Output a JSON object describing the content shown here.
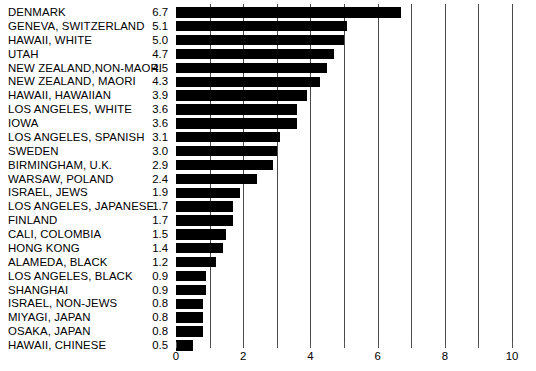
{
  "chart_data": {
    "type": "bar",
    "orientation": "horizontal",
    "title": "",
    "subtitle": "",
    "xlabel": "",
    "ylabel": "",
    "xlim": [
      0,
      10.6
    ],
    "xticks": [
      0,
      1,
      2,
      3,
      4,
      5,
      6,
      7,
      8,
      9,
      10
    ],
    "xtick_labels": [
      "0",
      "",
      "2",
      "",
      "4",
      "",
      "6",
      "",
      "8",
      "",
      "10"
    ],
    "grid": "vertical",
    "legend": "none",
    "bar_color": "#000000",
    "gridline_color": "#4a4a4a",
    "background_color": "#ffffff",
    "categories": [
      "DENMARK",
      "GENEVA, SWITZERLAND",
      "HAWAII, WHITE",
      "UTAH",
      "NEW ZEALAND,NON-MAORI",
      "NEW ZEALAND, MAORI",
      "HAWAII, HAWAIIAN",
      "LOS ANGELES, WHITE",
      "IOWA",
      "LOS ANGELES, SPANISH",
      "SWEDEN",
      "BIRMINGHAM, U.K.",
      "WARSAW, POLAND",
      "ISRAEL, JEWS",
      "LOS ANGELES, JAPANESE",
      "FINLAND",
      "CALI, COLOMBIA",
      "HONG KONG",
      "ALAMEDA, BLACK",
      "LOS ANGELES, BLACK",
      "SHANGHAI",
      "ISRAEL, NON-JEWS",
      "MIYAGI, JAPAN",
      "OSAKA, JAPAN",
      "HAWAII, CHINESE"
    ],
    "values": [
      6.7,
      5.1,
      5.0,
      4.7,
      4.5,
      4.3,
      3.9,
      3.6,
      3.6,
      3.1,
      3.0,
      2.9,
      2.4,
      1.9,
      1.7,
      1.7,
      1.5,
      1.4,
      1.2,
      0.9,
      0.9,
      0.8,
      0.8,
      0.8,
      0.5
    ],
    "value_labels": [
      "6.7",
      "5.1",
      "5.0",
      "4.7",
      "4.5",
      "4.3",
      "3.9",
      "3.6",
      "3.6",
      "3.1",
      "3.0",
      "2.9",
      "2.4",
      "1.9",
      "1.7",
      "1.7",
      "1.5",
      "1.4",
      "1.2",
      "0.9",
      "0.9",
      "0.8",
      "0.8",
      "0.8",
      "0.5"
    ]
  }
}
